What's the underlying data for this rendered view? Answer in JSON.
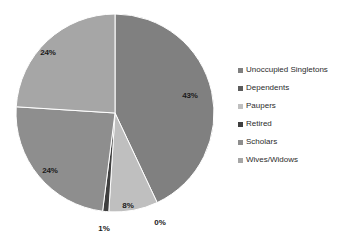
{
  "chart_data": {
    "type": "pie",
    "title": "",
    "subtitle": "",
    "xlabel": "",
    "ylabel": "",
    "grid": false,
    "legend_position": "right",
    "categories": [
      "Unoccupied Singletons",
      "Dependents",
      "Paupers",
      "Retired",
      "Scholars",
      "Wives/Widows"
    ],
    "values": [
      43,
      0,
      8,
      1,
      24,
      24
    ],
    "data_labels": [
      "43%",
      "0%",
      "8%",
      "1%",
      "24%",
      "24%"
    ],
    "colors": [
      "#808080",
      "#5c5c5c",
      "#bfbfbf",
      "#3f3f3f",
      "#8e8e8e",
      "#a6a6a6"
    ],
    "slices": [
      {
        "label": "Unoccupied Singletons",
        "value": 43,
        "data_label": "43%",
        "color": "#808080"
      },
      {
        "label": "Dependents",
        "value": 0,
        "data_label": "0%",
        "color": "#5c5c5c"
      },
      {
        "label": "Paupers",
        "value": 8,
        "data_label": "8%",
        "color": "#bfbfbf"
      },
      {
        "label": "Retired",
        "value": 1,
        "data_label": "1%",
        "color": "#3f3f3f"
      },
      {
        "label": "Scholars",
        "value": 24,
        "data_label": "24%",
        "color": "#8e8e8e"
      },
      {
        "label": "Wives/Widows",
        "value": 24,
        "data_label": "24%",
        "color": "#a6a6a6"
      }
    ]
  },
  "legend": {
    "items": [
      {
        "label": "Unoccupied Singletons",
        "color": "#808080"
      },
      {
        "label": "Dependents",
        "color": "#5c5c5c"
      },
      {
        "label": "Paupers",
        "color": "#bfbfbf"
      },
      {
        "label": "Retired",
        "color": "#3f3f3f"
      },
      {
        "label": "Scholars",
        "color": "#8e8e8e"
      },
      {
        "label": "Wives/Widows",
        "color": "#a6a6a6"
      }
    ]
  },
  "labels": {
    "pct_43": "43%",
    "pct_0": "0%",
    "pct_8": "8%",
    "pct_1": "1%",
    "pct_24_lower": "24%",
    "pct_24_upper": "24%"
  }
}
